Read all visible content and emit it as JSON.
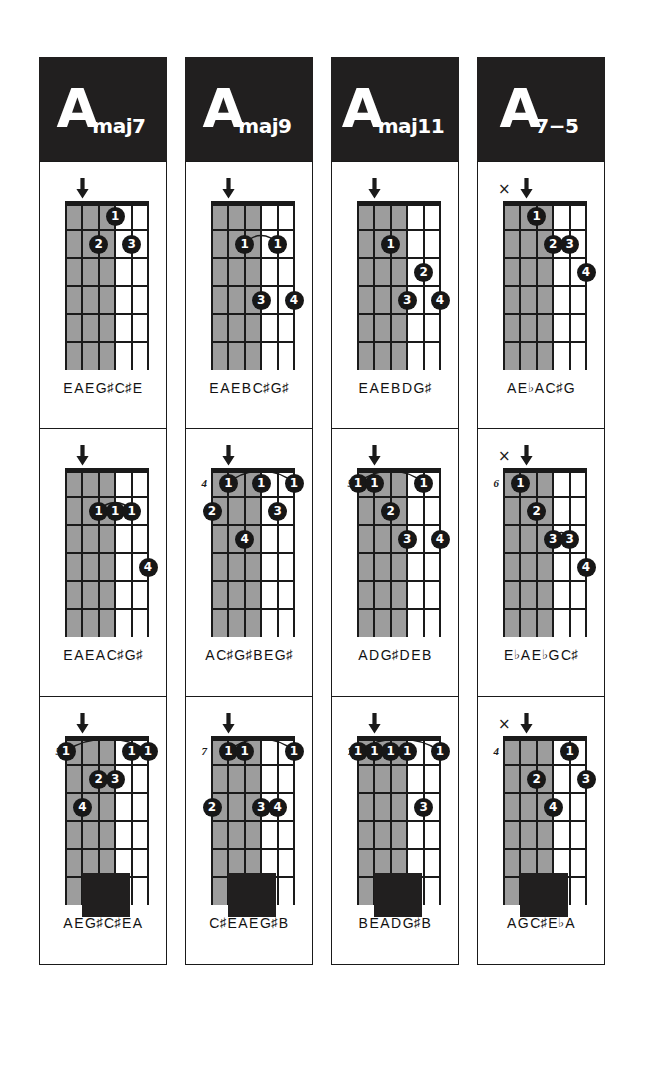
{
  "page": {
    "instrument": "guitar",
    "diagram_type": "chord-chart",
    "strings": 6,
    "frets": 6,
    "colors": {
      "ink": "#1a1a1a",
      "header_bg": "#211f1f",
      "shade": "#9d9d9d",
      "paper": "#ffffff",
      "dot_fill": "#171717",
      "dot_text": "#ffffff"
    },
    "marks": {
      "arrow": "down-arrow",
      "mute": "x"
    }
  },
  "columns": [
    {
      "id": "amaj7",
      "header": {
        "root": "A",
        "suffix": "maj7"
      },
      "voicings": [
        {
          "id": "amaj7-v1",
          "fret_label": "",
          "mute_x": false,
          "arrow_string": 1,
          "shaded_strings": 3,
          "dots": [
            {
              "finger": "1",
              "string": 3,
              "fret": 1
            },
            {
              "finger": "2",
              "string": 2,
              "fret": 2
            },
            {
              "finger": "3",
              "string": 4,
              "fret": 2
            }
          ],
          "barre": null,
          "notes": [
            "E",
            "A",
            "E",
            "G#",
            "C#",
            "E"
          ]
        },
        {
          "id": "amaj7-v2",
          "fret_label": "",
          "mute_x": false,
          "arrow_string": 1,
          "shaded_strings": 3,
          "dots": [
            {
              "finger": "1",
              "string": 2,
              "fret": 2
            },
            {
              "finger": "1",
              "string": 3,
              "fret": 2
            },
            {
              "finger": "1",
              "string": 4,
              "fret": 2
            },
            {
              "finger": "4",
              "string": 5,
              "fret": 4
            }
          ],
          "barre": {
            "from_string": 2,
            "to_string": 4,
            "fret": 2
          },
          "notes": [
            "E",
            "A",
            "E",
            "A",
            "C#",
            "G#"
          ]
        },
        {
          "id": "amaj7-v3",
          "fret_label": "5",
          "mute_x": false,
          "arrow_string": 1,
          "shaded_strings": 3,
          "dots": [
            {
              "finger": "1",
              "string": 0,
              "fret": 1
            },
            {
              "finger": "1",
              "string": 4,
              "fret": 1
            },
            {
              "finger": "1",
              "string": 5,
              "fret": 1
            },
            {
              "finger": "2",
              "string": 2,
              "fret": 2
            },
            {
              "finger": "3",
              "string": 3,
              "fret": 2
            },
            {
              "finger": "4",
              "string": 1,
              "fret": 3
            }
          ],
          "barre": {
            "from_string": 0,
            "to_string": 5,
            "fret": 1
          },
          "notes": [
            "A",
            "E",
            "G#",
            "C#",
            "E",
            "A"
          ]
        }
      ]
    },
    {
      "id": "amaj9",
      "header": {
        "root": "A",
        "suffix": "maj9"
      },
      "voicings": [
        {
          "id": "amaj9-v1",
          "fret_label": "",
          "mute_x": false,
          "arrow_string": 1,
          "shaded_strings": 3,
          "dots": [
            {
              "finger": "1",
              "string": 2,
              "fret": 2
            },
            {
              "finger": "1",
              "string": 4,
              "fret": 2
            },
            {
              "finger": "3",
              "string": 3,
              "fret": 4
            },
            {
              "finger": "4",
              "string": 5,
              "fret": 4
            }
          ],
          "barre": {
            "from_string": 2,
            "to_string": 4,
            "fret": 2
          },
          "notes": [
            "E",
            "A",
            "E",
            "B",
            "C#",
            "G#"
          ]
        },
        {
          "id": "amaj9-v2",
          "fret_label": "4",
          "mute_x": false,
          "arrow_string": 1,
          "shaded_strings": 3,
          "dots": [
            {
              "finger": "1",
              "string": 1,
              "fret": 1
            },
            {
              "finger": "1",
              "string": 3,
              "fret": 1
            },
            {
              "finger": "1",
              "string": 5,
              "fret": 1
            },
            {
              "finger": "2",
              "string": 0,
              "fret": 2
            },
            {
              "finger": "3",
              "string": 4,
              "fret": 2
            },
            {
              "finger": "4",
              "string": 2,
              "fret": 3
            }
          ],
          "barre": {
            "from_string": 1,
            "to_string": 5,
            "fret": 1
          },
          "notes": [
            "A",
            "C#",
            "G#",
            "B",
            "E",
            "G#"
          ]
        },
        {
          "id": "amaj9-v3",
          "fret_label": "7",
          "mute_x": false,
          "arrow_string": 2,
          "shaded_strings": 3,
          "dots": [
            {
              "finger": "1",
              "string": 1,
              "fret": 1
            },
            {
              "finger": "1",
              "string": 2,
              "fret": 1
            },
            {
              "finger": "1",
              "string": 5,
              "fret": 1
            },
            {
              "finger": "2",
              "string": 0,
              "fret": 3
            },
            {
              "finger": "3",
              "string": 3,
              "fret": 3
            },
            {
              "finger": "4",
              "string": 4,
              "fret": 3
            }
          ],
          "barre": {
            "from_string": 1,
            "to_string": 5,
            "fret": 1
          },
          "notes": [
            "C#",
            "E",
            "A",
            "E",
            "G#",
            "B"
          ]
        }
      ]
    },
    {
      "id": "amaj11",
      "header": {
        "root": "A",
        "suffix": "maj11"
      },
      "voicings": [
        {
          "id": "amaj11-v1",
          "fret_label": "",
          "mute_x": false,
          "arrow_string": 1,
          "shaded_strings": 3,
          "dots": [
            {
              "finger": "1",
              "string": 2,
              "fret": 2
            },
            {
              "finger": "2",
              "string": 4,
              "fret": 3
            },
            {
              "finger": "3",
              "string": 3,
              "fret": 4
            },
            {
              "finger": "4",
              "string": 5,
              "fret": 4
            }
          ],
          "barre": null,
          "notes": [
            "E",
            "A",
            "E",
            "B",
            "D",
            "G#"
          ]
        },
        {
          "id": "amaj11-v2",
          "fret_label": "5",
          "mute_x": false,
          "arrow_string": 1,
          "shaded_strings": 3,
          "dots": [
            {
              "finger": "1",
              "string": 0,
              "fret": 1
            },
            {
              "finger": "1",
              "string": 1,
              "fret": 1
            },
            {
              "finger": "1",
              "string": 4,
              "fret": 1
            },
            {
              "finger": "2",
              "string": 2,
              "fret": 2
            },
            {
              "finger": "3",
              "string": 3,
              "fret": 3
            },
            {
              "finger": "4",
              "string": 5,
              "fret": 3
            }
          ],
          "barre": {
            "from_string": 0,
            "to_string": 4,
            "fret": 1
          },
          "notes": [
            "A",
            "D",
            "G#",
            "D",
            "E",
            "B"
          ]
        },
        {
          "id": "amaj11-v3",
          "fret_label": "7",
          "mute_x": false,
          "arrow_string": 2,
          "shaded_strings": 3,
          "dots": [
            {
              "finger": "1",
              "string": 0,
              "fret": 1
            },
            {
              "finger": "1",
              "string": 1,
              "fret": 1
            },
            {
              "finger": "1",
              "string": 2,
              "fret": 1
            },
            {
              "finger": "1",
              "string": 3,
              "fret": 1
            },
            {
              "finger": "1",
              "string": 5,
              "fret": 1
            },
            {
              "finger": "3",
              "string": 4,
              "fret": 3
            }
          ],
          "barre": {
            "from_string": 0,
            "to_string": 5,
            "fret": 1
          },
          "notes": [
            "B",
            "E",
            "A",
            "D",
            "G#",
            "B"
          ]
        }
      ]
    },
    {
      "id": "a7-5",
      "header": {
        "root": "A",
        "suffix": "7−5"
      },
      "voicings": [
        {
          "id": "a7-5-v1",
          "fret_label": "",
          "mute_x": true,
          "arrow_string": 1,
          "shaded_strings": 3,
          "dots": [
            {
              "finger": "1",
              "string": 2,
              "fret": 1
            },
            {
              "finger": "2",
              "string": 3,
              "fret": 2
            },
            {
              "finger": "3",
              "string": 4,
              "fret": 2
            },
            {
              "finger": "4",
              "string": 5,
              "fret": 3
            }
          ],
          "barre": null,
          "notes": [
            "A",
            "Eb",
            "A",
            "C#",
            "G"
          ]
        },
        {
          "id": "a7-5-v2",
          "fret_label": "6",
          "mute_x": true,
          "arrow_string": 1,
          "shaded_strings": 3,
          "dots": [
            {
              "finger": "1",
              "string": 1,
              "fret": 1
            },
            {
              "finger": "2",
              "string": 2,
              "fret": 2
            },
            {
              "finger": "3",
              "string": 3,
              "fret": 3
            },
            {
              "finger": "3",
              "string": 4,
              "fret": 3
            },
            {
              "finger": "4",
              "string": 5,
              "fret": 4
            }
          ],
          "barre": {
            "from_string": 3,
            "to_string": 4,
            "fret": 3
          },
          "notes": [
            "Eb",
            "A",
            "Eb",
            "G",
            "C#"
          ]
        },
        {
          "id": "a7-5-v3",
          "fret_label": "4",
          "mute_x": true,
          "arrow_string": 1,
          "shaded_strings": 3,
          "dots": [
            {
              "finger": "1",
              "string": 4,
              "fret": 1
            },
            {
              "finger": "2",
              "string": 2,
              "fret": 2
            },
            {
              "finger": "3",
              "string": 5,
              "fret": 2
            },
            {
              "finger": "4",
              "string": 3,
              "fret": 3
            }
          ],
          "barre": null,
          "notes": [
            "A",
            "G",
            "C#",
            "Eb",
            "A"
          ]
        }
      ]
    }
  ]
}
